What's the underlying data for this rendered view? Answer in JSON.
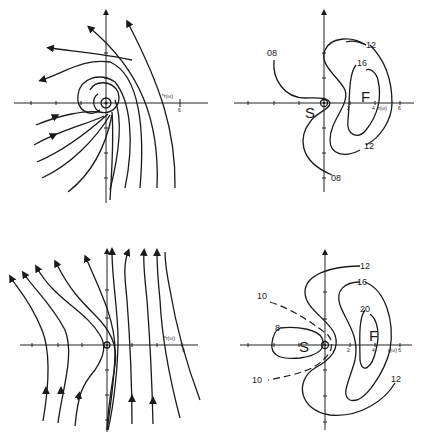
{
  "figure": {
    "panels": [
      {
        "id": "top-left",
        "type": "phase-portrait",
        "axis_label": "r(ω)",
        "tick_label": "6"
      },
      {
        "id": "top-right",
        "type": "contour",
        "contour_labels": [
          "08",
          "08",
          "12",
          "12",
          "16"
        ],
        "points": [
          "S",
          "F"
        ],
        "axis_ticks": [
          "2",
          "4",
          "6"
        ],
        "axis_label": "r(ω)"
      },
      {
        "id": "bottom-left",
        "type": "phase-portrait",
        "axis_label": "r(ω)",
        "tick_label": "6"
      },
      {
        "id": "bottom-right",
        "type": "contour",
        "contour_labels": [
          "12",
          "16",
          "20",
          "8",
          "10",
          "10",
          "12"
        ],
        "points": [
          "S",
          "F"
        ],
        "axis_ticks": [
          "2",
          "4",
          "r(ω) 6"
        ]
      }
    ]
  },
  "tl": {
    "axis": "*r(ω)",
    "tick6": "6"
  },
  "tr": {
    "c08a": "08",
    "c08b": "08",
    "c12a": "12",
    "c12b": "12",
    "c16": "16",
    "S": "S",
    "F": "F",
    "t2": "2",
    "t4": "4",
    "t6": "6",
    "ax": "r(ω)"
  },
  "bl": {
    "axis": "*r(ω)",
    "tick6": "6"
  },
  "br": {
    "c12a": "12",
    "c16": "16",
    "c20": "20",
    "c8": "8",
    "c10a": "10",
    "c10b": "10",
    "c12b": "12",
    "S": "S",
    "F": "F",
    "t2": "2",
    "t4": "4",
    "ax": "r(ω) 6"
  }
}
